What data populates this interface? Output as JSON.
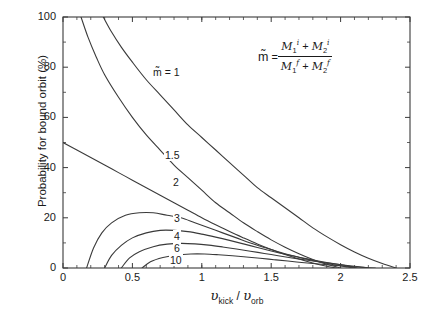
{
  "chart_data": {
    "type": "line",
    "title": "",
    "xlabel": "υ_kick / υ_orb",
    "ylabel": "Probability for bound orbit (%)",
    "xlim": [
      0,
      2.5
    ],
    "ylim": [
      0,
      100
    ],
    "xticks": [
      "0",
      "0.5",
      "1",
      "1.5",
      "2",
      "2.5"
    ],
    "xtick_values": [
      0,
      0.5,
      1,
      1.5,
      2,
      2.5
    ],
    "yticks": [
      "0",
      "20",
      "40",
      "60",
      "80",
      "100"
    ],
    "ytick_values": [
      0,
      20,
      40,
      60,
      80,
      100
    ],
    "minor_ticks": true,
    "grid": false,
    "legend": "inline curve labels",
    "annotation": "m̃ = (M₁ⁱ + M₂ⁱ) / (M₁ᶠ + M₂ᶠ)",
    "series": [
      {
        "name": "1",
        "label": "m̃ = 1",
        "points": [
          [
            0.29,
            100
          ],
          [
            0.35,
            94
          ],
          [
            0.42,
            88
          ],
          [
            0.5,
            82
          ],
          [
            0.6,
            75
          ],
          [
            0.7,
            69
          ],
          [
            0.8,
            63
          ],
          [
            0.9,
            57
          ],
          [
            1.0,
            52
          ],
          [
            1.1,
            47
          ],
          [
            1.2,
            42
          ],
          [
            1.3,
            37
          ],
          [
            1.4,
            32
          ],
          [
            1.5,
            28
          ],
          [
            1.6,
            24
          ],
          [
            1.7,
            20
          ],
          [
            1.8,
            16
          ],
          [
            1.9,
            12.5
          ],
          [
            2.0,
            9.3
          ],
          [
            2.1,
            6.4
          ],
          [
            2.2,
            3.9
          ],
          [
            2.3,
            1.8
          ],
          [
            2.4,
            0
          ]
        ]
      },
      {
        "name": "1.5",
        "label": "1.5",
        "points": [
          [
            0.13,
            100
          ],
          [
            0.18,
            92
          ],
          [
            0.24,
            84
          ],
          [
            0.3,
            77
          ],
          [
            0.4,
            68
          ],
          [
            0.5,
            60
          ],
          [
            0.6,
            53
          ],
          [
            0.7,
            47
          ],
          [
            0.8,
            41
          ],
          [
            0.9,
            36
          ],
          [
            1.0,
            31
          ],
          [
            1.1,
            26
          ],
          [
            1.2,
            22
          ],
          [
            1.3,
            18
          ],
          [
            1.4,
            14.5
          ],
          [
            1.5,
            11.2
          ],
          [
            1.6,
            8.3
          ],
          [
            1.7,
            5.7
          ],
          [
            1.8,
            3.4
          ],
          [
            1.9,
            1.5
          ],
          [
            2.0,
            0
          ]
        ]
      },
      {
        "name": "2",
        "label": "2",
        "points": [
          [
            0,
            50
          ],
          [
            0.1,
            47
          ],
          [
            0.2,
            44
          ],
          [
            0.3,
            41
          ],
          [
            0.4,
            38
          ],
          [
            0.5,
            35
          ],
          [
            0.6,
            32
          ],
          [
            0.7,
            29
          ],
          [
            0.8,
            26
          ],
          [
            0.9,
            23
          ],
          [
            1.0,
            20
          ],
          [
            1.1,
            17.2
          ],
          [
            1.2,
            14.5
          ],
          [
            1.3,
            12
          ],
          [
            1.4,
            9.6
          ],
          [
            1.5,
            7.4
          ],
          [
            1.6,
            5.4
          ],
          [
            1.7,
            3.6
          ],
          [
            1.8,
            2.0
          ],
          [
            1.9,
            0.7
          ],
          [
            1.97,
            0
          ]
        ]
      },
      {
        "name": "3",
        "label": "3",
        "points": [
          [
            0.17,
            0
          ],
          [
            0.22,
            8
          ],
          [
            0.28,
            14
          ],
          [
            0.35,
            18
          ],
          [
            0.45,
            21
          ],
          [
            0.55,
            22
          ],
          [
            0.65,
            22
          ],
          [
            0.75,
            21
          ],
          [
            0.85,
            20
          ],
          [
            0.95,
            18
          ],
          [
            1.05,
            16
          ],
          [
            1.15,
            14
          ],
          [
            1.25,
            12
          ],
          [
            1.35,
            10
          ],
          [
            1.45,
            8.2
          ],
          [
            1.55,
            6.5
          ],
          [
            1.65,
            5.0
          ],
          [
            1.75,
            3.6
          ],
          [
            1.85,
            2.4
          ],
          [
            1.95,
            1.3
          ],
          [
            2.05,
            0.4
          ],
          [
            2.1,
            0
          ]
        ]
      },
      {
        "name": "4",
        "label": "4",
        "points": [
          [
            0.3,
            0
          ],
          [
            0.35,
            5
          ],
          [
            0.42,
            9
          ],
          [
            0.5,
            12
          ],
          [
            0.6,
            14
          ],
          [
            0.7,
            15
          ],
          [
            0.8,
            15
          ],
          [
            0.9,
            14.5
          ],
          [
            1.0,
            13.5
          ],
          [
            1.1,
            12.3
          ],
          [
            1.2,
            11
          ],
          [
            1.3,
            9.6
          ],
          [
            1.4,
            8.2
          ],
          [
            1.5,
            6.8
          ],
          [
            1.6,
            5.5
          ],
          [
            1.7,
            4.3
          ],
          [
            1.8,
            3.2
          ],
          [
            1.9,
            2.2
          ],
          [
            2.0,
            1.3
          ],
          [
            2.05,
            0.8
          ],
          [
            2.12,
            0
          ]
        ]
      },
      {
        "name": "6",
        "label": "6",
        "points": [
          [
            0.42,
            0
          ],
          [
            0.48,
            4
          ],
          [
            0.55,
            6.5
          ],
          [
            0.65,
            8.5
          ],
          [
            0.75,
            9.5
          ],
          [
            0.85,
            9.8
          ],
          [
            0.95,
            9.6
          ],
          [
            1.05,
            9.1
          ],
          [
            1.15,
            8.4
          ],
          [
            1.25,
            7.6
          ],
          [
            1.35,
            6.7
          ],
          [
            1.45,
            5.8
          ],
          [
            1.55,
            4.9
          ],
          [
            1.65,
            4.0
          ],
          [
            1.75,
            3.2
          ],
          [
            1.85,
            2.4
          ],
          [
            1.95,
            1.7
          ],
          [
            2.05,
            1.0
          ],
          [
            2.15,
            0.4
          ],
          [
            2.2,
            0
          ]
        ]
      },
      {
        "name": "10",
        "label": "10",
        "points": [
          [
            0.57,
            0
          ],
          [
            0.63,
            2.5
          ],
          [
            0.72,
            4.2
          ],
          [
            0.82,
            5.2
          ],
          [
            0.92,
            5.6
          ],
          [
            1.02,
            5.6
          ],
          [
            1.12,
            5.3
          ],
          [
            1.22,
            4.9
          ],
          [
            1.32,
            4.4
          ],
          [
            1.42,
            3.9
          ],
          [
            1.52,
            3.3
          ],
          [
            1.62,
            2.8
          ],
          [
            1.72,
            2.2
          ],
          [
            1.82,
            1.7
          ],
          [
            1.92,
            1.2
          ],
          [
            2.02,
            0.8
          ],
          [
            2.12,
            0.4
          ],
          [
            2.2,
            0.1
          ],
          [
            2.25,
            0
          ]
        ]
      }
    ],
    "curve_labels": [
      {
        "text": "m̃ = 1",
        "x": 152,
        "y": 66
      },
      {
        "text": "1.5",
        "x": 164,
        "y": 149
      },
      {
        "text": "2",
        "x": 172,
        "y": 176
      },
      {
        "text": "3",
        "x": 173,
        "y": 212
      },
      {
        "text": "4",
        "x": 173,
        "y": 230
      },
      {
        "text": "6",
        "x": 173,
        "y": 242
      },
      {
        "text": "10",
        "x": 169,
        "y": 254
      }
    ],
    "formula": {
      "lhs": "m̃",
      "equals": "=",
      "numerator": "M₁ⁱ + M₂ⁱ",
      "denominator": "M₁ᶠ + M₂ᶠ"
    },
    "line_color": "#3a3a3a",
    "axis_color": "#3a3a3a",
    "background": "#ffffff"
  },
  "axes": {
    "ylabel": "Probability for bound orbit (%)",
    "xlabel_numerator": "υ",
    "xlabel_num_sub": "kick",
    "xlabel_slash": "/",
    "xlabel_denominator": "υ",
    "xlabel_den_sub": "orb",
    "xticks": [
      "0",
      "0.5",
      "1",
      "1.5",
      "2",
      "2.5"
    ],
    "yticks": [
      "0",
      "20",
      "40",
      "60",
      "80",
      "100"
    ]
  },
  "formula_parts": {
    "m_tilde": "m",
    "eq": "=",
    "M": "M",
    "sub1": "1",
    "sub2": "2",
    "sup_i": "i",
    "sup_f": "f",
    "plus": "+"
  }
}
